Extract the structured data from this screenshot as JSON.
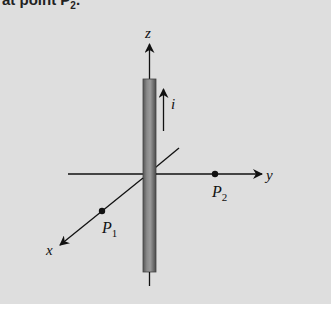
{
  "caption": {
    "text_prefix": "at point P",
    "subscript": "2",
    "text_suffix": "."
  },
  "figure": {
    "axes": {
      "z_label": "z",
      "y_label": "y",
      "x_label": "x"
    },
    "current": {
      "label": "i",
      "direction": "+z"
    },
    "points": [
      {
        "name": "P",
        "sub": "1",
        "axis": "x"
      },
      {
        "name": "P",
        "sub": "2",
        "axis": "y"
      }
    ],
    "colors": {
      "background": "#dedede",
      "rod": "#7a7a7a",
      "ink": "#111111"
    }
  }
}
